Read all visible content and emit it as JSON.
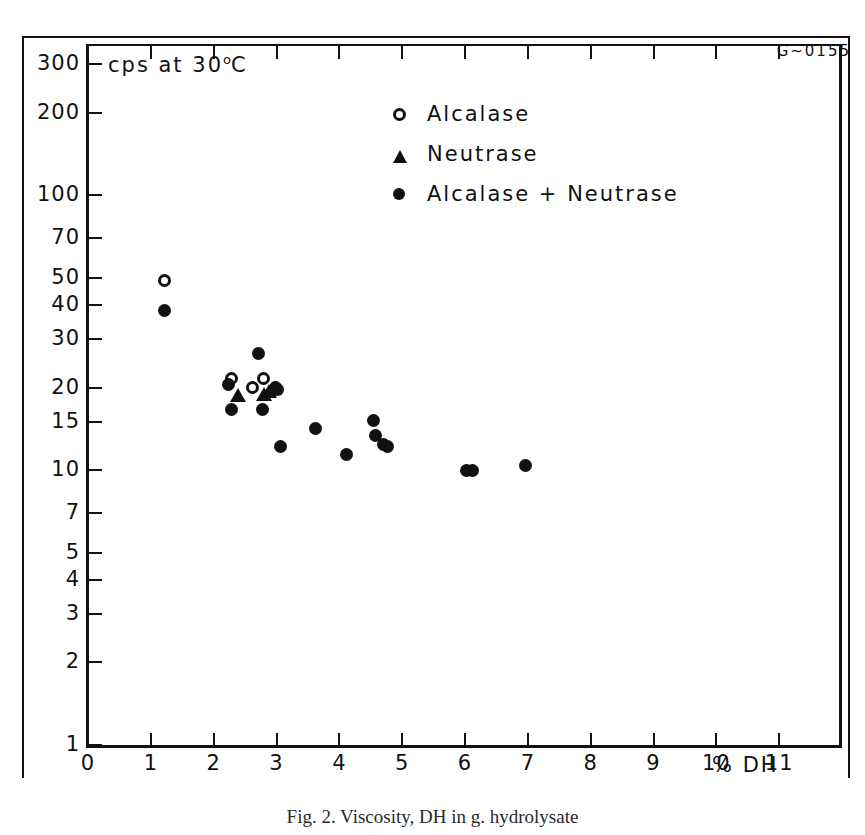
{
  "figure": {
    "corner_code": "G~0155",
    "caption": "Fig. 2. Viscosity, DH in g. hydrolysate"
  },
  "chart_data": {
    "type": "scatter",
    "title": "",
    "annotation": "cps at 30",
    "annotation_sup": "o",
    "annotation_tail": "C",
    "xlabel": "% DH",
    "ylabel": "cps at 30°C",
    "xlim": [
      0,
      12
    ],
    "ylim": [
      1,
      350
    ],
    "yscale": "log",
    "xscale": "linear",
    "grid": false,
    "legend_position": "upper-center",
    "xticks": [
      0,
      1,
      2,
      3,
      4,
      5,
      6,
      7,
      8,
      9,
      10,
      11
    ],
    "xtick_labels": [
      "0",
      "1",
      "2",
      "3",
      "4",
      "5",
      "6",
      "7",
      "8",
      "9",
      "10",
      "11"
    ],
    "yticks": [
      300,
      200,
      100,
      70,
      50,
      40,
      30,
      20,
      15,
      10,
      7,
      5,
      4,
      3,
      2,
      1
    ],
    "ytick_labels": [
      "300",
      "200",
      "100",
      "70",
      "50",
      "40",
      "30",
      "20",
      "15",
      "10",
      "7",
      "5",
      "4",
      "3",
      "2",
      "1"
    ],
    "series": [
      {
        "name": "Alcalase",
        "marker": "open-circle",
        "color": "#111111",
        "points": [
          {
            "x": 1.22,
            "y": 49.0
          },
          {
            "x": 2.28,
            "y": 21.5
          },
          {
            "x": 2.62,
            "y": 20.0
          },
          {
            "x": 2.8,
            "y": 21.5
          }
        ]
      },
      {
        "name": "Neutrase",
        "marker": "filled-triangle",
        "color": "#111111",
        "points": [
          {
            "x": 2.38,
            "y": 18.6
          },
          {
            "x": 2.8,
            "y": 18.8
          },
          {
            "x": 2.88,
            "y": 19.2
          },
          {
            "x": 2.96,
            "y": 19.8
          }
        ]
      },
      {
        "name": "Alcalase + Neutrase",
        "marker": "filled-circle",
        "color": "#111111",
        "points": [
          {
            "x": 1.22,
            "y": 38.0
          },
          {
            "x": 2.24,
            "y": 20.6
          },
          {
            "x": 2.28,
            "y": 16.6
          },
          {
            "x": 2.72,
            "y": 26.5
          },
          {
            "x": 2.78,
            "y": 16.6
          },
          {
            "x": 2.98,
            "y": 20.0
          },
          {
            "x": 3.02,
            "y": 19.6
          },
          {
            "x": 3.06,
            "y": 12.2
          },
          {
            "x": 3.62,
            "y": 14.2
          },
          {
            "x": 4.12,
            "y": 11.4
          },
          {
            "x": 4.54,
            "y": 15.2
          },
          {
            "x": 4.58,
            "y": 13.4
          },
          {
            "x": 4.7,
            "y": 12.4
          },
          {
            "x": 4.76,
            "y": 12.2
          },
          {
            "x": 6.02,
            "y": 10.0
          },
          {
            "x": 6.12,
            "y": 10.0
          },
          {
            "x": 6.96,
            "y": 10.4
          }
        ]
      }
    ]
  }
}
